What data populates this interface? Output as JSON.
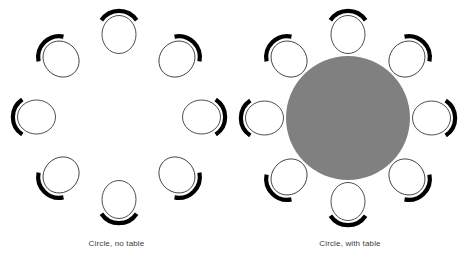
{
  "figure": {
    "background_color": "#ffffff",
    "width": 467,
    "height": 264
  },
  "style": {
    "seat_outline_color": "#3a3a3a",
    "seat_fill_color": "#ffffff",
    "seat_back_color": "#000000",
    "table_fill_color": "#808080",
    "caption_color": "#3d3d3d"
  },
  "panels": [
    {
      "id": "circle-no-table",
      "caption": "Circle, no table",
      "table": null,
      "layout": {
        "center_x": 119,
        "center_y": 117,
        "seat_ring_radius": 84,
        "seat_count": 8,
        "seat_rx": 17,
        "seat_ry": 19
      },
      "seats": [
        {
          "index": 1,
          "label": "seat-top",
          "angle_deg": 270,
          "x": 119,
          "y": 33
        },
        {
          "index": 2,
          "label": "seat-upper-right",
          "angle_deg": 315,
          "x": 178,
          "y": 58
        },
        {
          "index": 3,
          "label": "seat-right",
          "angle_deg": 0,
          "x": 203,
          "y": 117
        },
        {
          "index": 4,
          "label": "seat-lower-right",
          "angle_deg": 45,
          "x": 178,
          "y": 176
        },
        {
          "index": 5,
          "label": "seat-bottom",
          "angle_deg": 90,
          "x": 119,
          "y": 201
        },
        {
          "index": 6,
          "label": "seat-lower-left",
          "angle_deg": 135,
          "x": 60,
          "y": 176
        },
        {
          "index": 7,
          "label": "seat-left",
          "angle_deg": 180,
          "x": 35,
          "y": 117
        },
        {
          "index": 8,
          "label": "seat-upper-left",
          "angle_deg": 225,
          "x": 60,
          "y": 58
        }
      ]
    },
    {
      "id": "circle-with-table",
      "caption": "Circle, with table",
      "table": {
        "shape": "circle",
        "center_x": 115,
        "center_y": 118,
        "radius": 62,
        "fill": "#808080"
      },
      "layout": {
        "center_x": 115,
        "center_y": 118,
        "seat_ring_radius": 85,
        "seat_count": 8,
        "seat_rx": 17,
        "seat_ry": 19
      },
      "seats": [
        {
          "index": 1,
          "label": "seat-top",
          "angle_deg": 270,
          "x": 115,
          "y": 33
        },
        {
          "index": 2,
          "label": "seat-upper-right",
          "angle_deg": 315,
          "x": 175,
          "y": 58
        },
        {
          "index": 3,
          "label": "seat-right",
          "angle_deg": 0,
          "x": 200,
          "y": 118
        },
        {
          "index": 4,
          "label": "seat-lower-right",
          "angle_deg": 45,
          "x": 175,
          "y": 178
        },
        {
          "index": 5,
          "label": "seat-bottom",
          "angle_deg": 90,
          "x": 115,
          "y": 203
        },
        {
          "index": 6,
          "label": "seat-lower-left",
          "angle_deg": 135,
          "x": 55,
          "y": 178
        },
        {
          "index": 7,
          "label": "seat-left",
          "angle_deg": 180,
          "x": 30,
          "y": 118
        },
        {
          "index": 8,
          "label": "seat-upper-left",
          "angle_deg": 225,
          "x": 55,
          "y": 58
        }
      ]
    }
  ]
}
